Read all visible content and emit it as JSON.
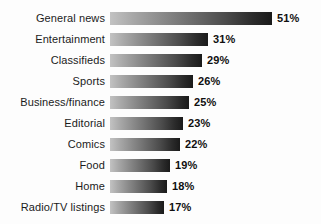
{
  "chart_data": {
    "type": "bar",
    "orientation": "horizontal",
    "title": "",
    "subtitle": "",
    "xlabel": "",
    "ylabel": "",
    "grid": false,
    "legend": null,
    "legend_position": "none",
    "axis_visible": false,
    "xlim": [
      0,
      51
    ],
    "value_suffix": "%",
    "categories": [
      "General news",
      "Entertainment",
      "Classifieds",
      "Sports",
      "Business/finance",
      "Editorial",
      "Comics",
      "Food",
      "Home",
      "Radio/TV listings"
    ],
    "values": [
      51,
      31,
      29,
      26,
      25,
      23,
      22,
      19,
      18,
      17
    ],
    "value_labels": [
      "51%",
      "31%",
      "29%",
      "26%",
      "25%",
      "23%",
      "22%",
      "19%",
      "18%",
      "17%"
    ],
    "bars": [
      {
        "category": "General news",
        "value": 51,
        "label": "51%"
      },
      {
        "category": "Entertainment",
        "value": 31,
        "label": "31%"
      },
      {
        "category": "Classifieds",
        "value": 29,
        "label": "29%"
      },
      {
        "category": "Sports",
        "value": 26,
        "label": "26%"
      },
      {
        "category": "Business/finance",
        "value": 25,
        "label": "25%"
      },
      {
        "category": "Editorial",
        "value": 23,
        "label": "23%"
      },
      {
        "category": "Comics",
        "value": 22,
        "label": "22%"
      },
      {
        "category": "Food",
        "value": 19,
        "label": "19%"
      },
      {
        "category": "Home",
        "value": 18,
        "label": "18%"
      },
      {
        "category": "Radio/TV listings",
        "value": 17,
        "label": "17%"
      }
    ],
    "style": {
      "background": "#fdfdfd",
      "bar_gradient_start": "#c2c2c2",
      "bar_gradient_end": "#1a1a1a",
      "label_color": "#1b1b1b",
      "value_color": "#101010"
    }
  }
}
